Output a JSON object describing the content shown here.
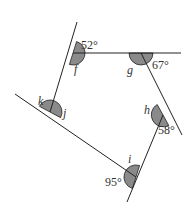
{
  "diagram": {
    "type": "pentagon-exterior-angles",
    "colors": {
      "line": "#222222",
      "angle_fill": "#8a8a8a",
      "text": "#333333"
    },
    "vertices": [
      {
        "id": "F",
        "interior": "f",
        "exterior": "52°"
      },
      {
        "id": "G",
        "interior": "g",
        "exterior": "67°"
      },
      {
        "id": "H",
        "interior": "h",
        "exterior": "58°"
      },
      {
        "id": "I",
        "interior": "i",
        "exterior": "95°"
      },
      {
        "id": "J",
        "interior": "j",
        "exterior": "k"
      }
    ],
    "labels": {
      "f": "f",
      "g": "g",
      "h": "h",
      "i": "i",
      "j": "j",
      "k": "k",
      "angle_52": "52°",
      "angle_67": "67°",
      "angle_58": "58°",
      "angle_95": "95°"
    }
  }
}
